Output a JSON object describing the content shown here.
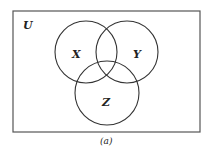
{
  "diagram": {
    "type": "venn",
    "universe_label": "U",
    "sets": [
      {
        "label": "X"
      },
      {
        "label": "Y"
      },
      {
        "label": "Z"
      }
    ],
    "caption": "(a)",
    "colors": {
      "stroke": "#333333",
      "background": "#ffffff"
    }
  }
}
